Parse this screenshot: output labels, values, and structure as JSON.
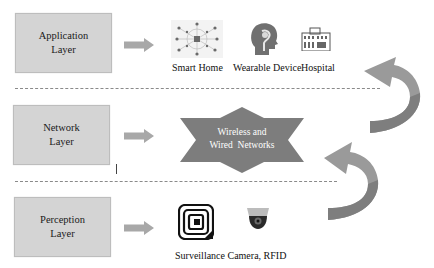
{
  "layers": [
    {
      "name": "Application Layer",
      "line1": "Application",
      "line2": "Layer"
    },
    {
      "name": "Network Layer",
      "line1": "Network",
      "line2": "Layer"
    },
    {
      "name": "Perception Layer",
      "line1": "Perception",
      "line2": "Layer"
    }
  ],
  "application": {
    "items": [
      {
        "label": "Smart Home",
        "icon": "smart-home-network-icon"
      },
      {
        "label": "Wearable Device",
        "icon": "head-brain-icon"
      },
      {
        "label": "Hospital",
        "icon": "hospital-building-icon"
      }
    ]
  },
  "network": {
    "star_line1": "Wireless and",
    "star_line2": "Wired  Networks"
  },
  "perception": {
    "label": "Surveillance Camera, RFID",
    "icons": [
      "rfid-tag-icon",
      "dome-camera-icon"
    ]
  },
  "colors": {
    "box_fill": "#d4d4d4",
    "arrow_fill": "#a8a8a8",
    "star_fill": "#7d7d7d",
    "curved_arrow": "#9a9a9a",
    "dash": "#8a8a8a"
  }
}
